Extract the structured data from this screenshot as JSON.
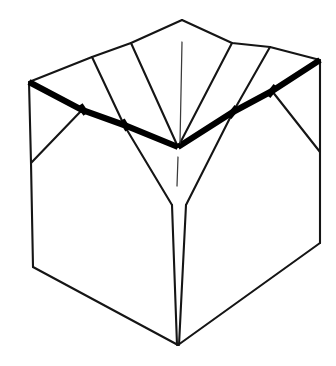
{
  "figure": {
    "title": "Open cardboard box line drawing",
    "background_color": "#ffffff",
    "line_color": "#151515",
    "bold_line_color": "#000000",
    "hairline_color": "#3a3a3a",
    "canvas": {
      "width": 336,
      "height": 366
    }
  },
  "geometry": {
    "points": {
      "top_apex": [
        182,
        20
      ],
      "left_corner": [
        29,
        82
      ],
      "right_corner": [
        320,
        60
      ],
      "center_v": [
        178,
        147
      ],
      "bottom_apex": [
        178,
        345
      ],
      "left_body_bottom": [
        33,
        267
      ],
      "right_body_bottom": [
        320,
        243
      ],
      "left_body_top": [
        31,
        163
      ],
      "right_body_top": [
        320,
        152
      ],
      "flap_left_outer": [
        92,
        57
      ],
      "flap_left_inner": [
        131,
        43
      ],
      "flap_right_inner": [
        232,
        43
      ],
      "flap_right_outer": [
        270,
        47
      ],
      "rim_kink_left": [
        82,
        110
      ],
      "rim_kink_mid_left": [
        124,
        125
      ],
      "rim_kink_mid_right": [
        233,
        112
      ],
      "rim_kink_right": [
        272,
        91
      ],
      "sliver_left": [
        172,
        205
      ],
      "sliver_right": [
        186,
        205
      ]
    },
    "paths": {
      "body_outline": "M 29 82 L 31 163 L 33 267 L 178 345 L 320 243 L 320 152 L 320 60",
      "rim_bold": "M 29 82 L 82 110 L 124 125 L 178 147 L 233 112 L 272 91 L 320 60",
      "flap_top_left_edge": "M 29 82 L 92 57 L 131 43 L 182 20",
      "flap_top_right_edge": "M 182 20 L 232 43 L 270 47 L 320 60",
      "crease_left_outer": "M 92 57 L 124 125",
      "crease_left_inner": "M 131 43 L 178 147",
      "crease_right_inner": "M 232 43 L 178 147",
      "crease_right_outer": "M 270 47 L 233 112",
      "flap_fold_left": "M 82 110 L 31 163",
      "flap_fold_right": "M 272 91 L 320 152",
      "inner_wall_left": "M 124 125 L 172 205",
      "inner_wall_right": "M 233 112 L 186 205",
      "sliver_left_edge": "M 172 205 L 177 345",
      "sliver_right_edge": "M 186 205 L 179 345",
      "hairline_upper": "M 182 42 L 180 143",
      "hairline_lower": "M 178 157 L 177 186"
    }
  },
  "elements": [
    {
      "name": "box-body-outline",
      "label": "Box body outline"
    },
    {
      "name": "bold-rim",
      "label": "Bold folded rim"
    },
    {
      "name": "top-flaps",
      "label": "Top flaps"
    },
    {
      "name": "inner-funnel",
      "label": "Inner funnel V"
    },
    {
      "name": "center-crease",
      "label": "Center crease hairline"
    }
  ]
}
